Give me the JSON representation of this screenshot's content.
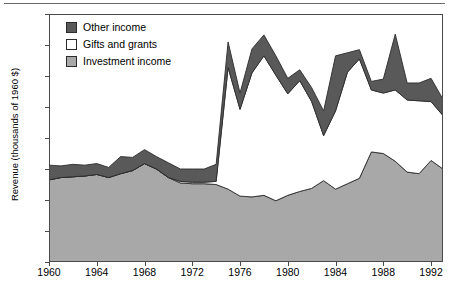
{
  "chart_data": {
    "type": "area",
    "stacked": true,
    "title": "",
    "subtitle": "",
    "xlabel": "",
    "ylabel": "Revenue (thousands of 1960 $)",
    "xlim": [
      1960,
      1993
    ],
    "ylim": [
      0,
      1600
    ],
    "ytick_labels": [
      "0",
      "200",
      "400",
      "600",
      "800",
      "1,000",
      "1,200",
      "1,400",
      "1,600"
    ],
    "ytick_values": [
      0,
      200,
      400,
      600,
      800,
      1000,
      1200,
      1400,
      1600
    ],
    "xtick_labels": [
      "1960",
      "1964",
      "1968",
      "1972",
      "1976",
      "1980",
      "1984",
      "1988",
      "1992"
    ],
    "xtick_values": [
      1960,
      1964,
      1968,
      1972,
      1976,
      1980,
      1984,
      1988,
      1992
    ],
    "grid": false,
    "legend_position": "top-left",
    "legend": [
      "Other income",
      "Gifts and grants",
      "Investment income"
    ],
    "colors": {
      "other_income": "#595959",
      "gifts_and_grants": "#ffffff",
      "investment_income": "#a8a8a8",
      "outline": "#2b2b2b",
      "axis": "#4a4a4a",
      "text": "#000000",
      "background": "#ffffff"
    },
    "x": [
      1960,
      1961,
      1962,
      1963,
      1964,
      1965,
      1966,
      1967,
      1968,
      1969,
      1970,
      1971,
      1972,
      1973,
      1974,
      1975,
      1976,
      1977,
      1978,
      1979,
      1980,
      1981,
      1982,
      1983,
      1984,
      1985,
      1986,
      1987,
      1988,
      1989,
      1990,
      1991,
      1992,
      1993
    ],
    "series": [
      {
        "name": "Investment income",
        "values": [
          530,
          545,
          550,
          555,
          565,
          545,
          570,
          590,
          635,
          600,
          545,
          510,
          505,
          505,
          500,
          470,
          425,
          420,
          430,
          395,
          430,
          455,
          475,
          525,
          470,
          505,
          540,
          710,
          700,
          650,
          580,
          570,
          655,
          600
        ]
      },
      {
        "name": "Gifts and grants",
        "values": [
          0,
          0,
          0,
          0,
          0,
          0,
          0,
          0,
          0,
          0,
          0,
          10,
          10,
          10,
          20,
          785,
          560,
          800,
          900,
          810,
          655,
          715,
          560,
          290,
          505,
          720,
          770,
          400,
          390,
          460,
          465,
          470,
          380,
          345
        ]
      },
      {
        "name": "Other income",
        "values": [
          95,
          75,
          80,
          70,
          70,
          65,
          110,
          85,
          90,
          80,
          95,
          80,
          85,
          85,
          110,
          165,
          105,
          155,
          135,
          125,
          100,
          70,
          90,
          160,
          355,
          125,
          60,
          55,
          90,
          360,
          110,
          115,
          150,
          105
        ]
      }
    ],
    "totals_note": "Stacked totals: investment income (bottom), gifts and grants (middle), other income (top)"
  },
  "legend": {
    "items": [
      {
        "label": "Other income",
        "swatch": "#595959"
      },
      {
        "label": "Gifts and grants",
        "swatch": "#ffffff"
      },
      {
        "label": "Investment income",
        "swatch": "#a8a8a8"
      }
    ]
  },
  "axes": {
    "y_title": "Revenue (thousands of 1960 $)"
  }
}
